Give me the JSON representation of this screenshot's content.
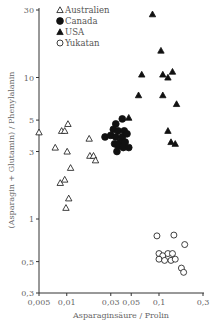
{
  "chart_data": {
    "type": "scatter",
    "title": "",
    "xlabel": "Asparaginsäure / Prolin",
    "ylabel": "(Asparagin + Glutamin) / Phenylalanin",
    "xscale": "log",
    "yscale": "log",
    "xlim": [
      0.005,
      0.3
    ],
    "ylim": [
      0.3,
      30
    ],
    "x_ticks": [
      0.005,
      0.01,
      0.03,
      0.05,
      0.1,
      0.3
    ],
    "x_tick_labels": [
      "0,005",
      "0,01",
      "0,03",
      "0,05",
      "0,1",
      "0,3"
    ],
    "y_ticks": [
      0.3,
      0.5,
      1,
      3,
      5,
      10,
      30
    ],
    "y_tick_labels": [
      "0,3",
      "0,5",
      "1",
      "3",
      "5",
      "10",
      "30"
    ],
    "grid": false,
    "legend_position": "upper left",
    "series": [
      {
        "name": "Australien",
        "marker": "triangle-open",
        "points": [
          [
            0.005,
            4.1
          ],
          [
            0.0075,
            3.2
          ],
          [
            0.0088,
            4.2
          ],
          [
            0.0095,
            4.2
          ],
          [
            0.0103,
            4.7
          ],
          [
            0.0101,
            3.0
          ],
          [
            0.0085,
            1.8
          ],
          [
            0.0095,
            1.9
          ],
          [
            0.011,
            2.3
          ],
          [
            0.0105,
            1.4
          ],
          [
            0.0098,
            1.2
          ],
          [
            0.0175,
            3.7
          ],
          [
            0.0178,
            2.8
          ],
          [
            0.0195,
            2.8
          ],
          [
            0.0205,
            2.6
          ]
        ]
      },
      {
        "name": "Canada",
        "marker": "circle-filled",
        "points": [
          [
            0.026,
            3.8
          ],
          [
            0.034,
            4.7
          ],
          [
            0.04,
            5.1
          ],
          [
            0.032,
            4.3
          ],
          [
            0.036,
            4.2
          ],
          [
            0.042,
            4.2
          ],
          [
            0.03,
            3.9
          ],
          [
            0.034,
            3.8
          ],
          [
            0.04,
            3.8
          ],
          [
            0.045,
            4.0
          ],
          [
            0.033,
            3.4
          ],
          [
            0.038,
            3.5
          ],
          [
            0.043,
            3.5
          ],
          [
            0.036,
            3.3
          ],
          [
            0.041,
            3.2
          ],
          [
            0.047,
            3.2
          ],
          [
            0.035,
            3.0
          ]
        ]
      },
      {
        "name": "USA",
        "marker": "triangle-filled",
        "points": [
          [
            0.047,
            5.2
          ],
          [
            0.085,
            28.0
          ],
          [
            0.105,
            15.5
          ],
          [
            0.065,
            10.5
          ],
          [
            0.11,
            10.5
          ],
          [
            0.125,
            10.0
          ],
          [
            0.14,
            11.0
          ],
          [
            0.06,
            7.5
          ],
          [
            0.11,
            7.5
          ],
          [
            0.155,
            6.5
          ],
          [
            0.125,
            4.2
          ],
          [
            0.135,
            3.5
          ],
          [
            0.15,
            3.4
          ]
        ]
      },
      {
        "name": "Yukatan",
        "marker": "circle-open",
        "points": [
          [
            0.095,
            0.76
          ],
          [
            0.145,
            0.77
          ],
          [
            0.19,
            0.66
          ],
          [
            0.1,
            0.57
          ],
          [
            0.11,
            0.55
          ],
          [
            0.125,
            0.57
          ],
          [
            0.14,
            0.57
          ],
          [
            0.1,
            0.52
          ],
          [
            0.115,
            0.51
          ],
          [
            0.135,
            0.51
          ],
          [
            0.15,
            0.52
          ],
          [
            0.175,
            0.45
          ],
          [
            0.185,
            0.42
          ]
        ]
      }
    ]
  },
  "legend": {
    "items": [
      {
        "label": "Australien",
        "marker": "triangle-open"
      },
      {
        "label": "Canada",
        "marker": "circle-filled"
      },
      {
        "label": "USA",
        "marker": "triangle-filled"
      },
      {
        "label": "Yukatan",
        "marker": "circle-open"
      }
    ]
  },
  "colors": {
    "axis": "#333333",
    "marker": "#111111",
    "text": "#666666"
  }
}
